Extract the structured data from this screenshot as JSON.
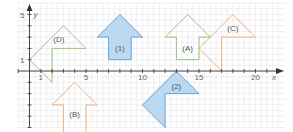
{
  "diagram": {
    "x_axis_label": "x",
    "y_axis_label": "y",
    "x_range": [
      -1,
      22
    ],
    "y_range": [
      -6,
      6
    ],
    "x_tick_labels": [
      {
        "value": 1,
        "label": "1"
      },
      {
        "value": 5,
        "label": "5"
      },
      {
        "value": 10,
        "label": "10"
      },
      {
        "value": 15,
        "label": "15"
      },
      {
        "value": 20,
        "label": "20"
      }
    ],
    "y_tick_labels": [
      {
        "value": 1,
        "label": "1"
      },
      {
        "value": 5,
        "label": "5"
      }
    ],
    "shapes": [
      {
        "id": "D",
        "label": "(D)",
        "color": "#8cc06a",
        "filled": false,
        "label_at": [
          2.6,
          2.8
        ],
        "points": [
          [
            0,
            1
          ],
          [
            3,
            4
          ],
          [
            5,
            2
          ],
          [
            2,
            2
          ],
          [
            2,
            -1
          ],
          [
            1,
            0
          ]
        ]
      },
      {
        "id": "1",
        "label": "(1)",
        "color": "#5b9bd5",
        "fill": "#bcd9f2",
        "filled": true,
        "label_at": [
          8,
          2.0
        ],
        "points": [
          [
            8,
            5
          ],
          [
            10,
            3
          ],
          [
            9,
            3
          ],
          [
            9,
            1
          ],
          [
            7,
            1
          ],
          [
            7,
            3
          ],
          [
            6,
            3
          ]
        ]
      },
      {
        "id": "A",
        "label": "(A)",
        "color": "#8cc06a",
        "filled": false,
        "label_at": [
          14,
          2.0
        ],
        "points": [
          [
            14,
            5
          ],
          [
            16,
            3
          ],
          [
            15,
            3
          ],
          [
            15,
            1
          ],
          [
            13,
            1
          ],
          [
            13,
            3
          ],
          [
            12,
            3
          ]
        ]
      },
      {
        "id": "C",
        "label": "(C)",
        "color": "#f0a870",
        "filled": false,
        "label_at": [
          18,
          3.8
        ],
        "points": [
          [
            18,
            5
          ],
          [
            20,
            3
          ],
          [
            17,
            3
          ],
          [
            17,
            0
          ],
          [
            15,
            2
          ],
          [
            16,
            3
          ]
        ]
      },
      {
        "id": "B",
        "label": "(B)",
        "color": "#f0a870",
        "filled": false,
        "label_at": [
          4,
          -3.8
        ],
        "points": [
          [
            4,
            -1
          ],
          [
            6,
            -3
          ],
          [
            5,
            -3
          ],
          [
            5,
            -6
          ],
          [
            3,
            -6
          ],
          [
            3,
            -3
          ],
          [
            2,
            -3
          ]
        ]
      },
      {
        "id": "2",
        "label": "(2)",
        "color": "#5b9bd5",
        "fill": "#bcd9f2",
        "filled": true,
        "label_at": [
          13,
          -1.3
        ],
        "points": [
          [
            13,
            0
          ],
          [
            15,
            -2
          ],
          [
            12,
            -2
          ],
          [
            12,
            -5
          ],
          [
            10,
            -3
          ]
        ]
      }
    ]
  }
}
